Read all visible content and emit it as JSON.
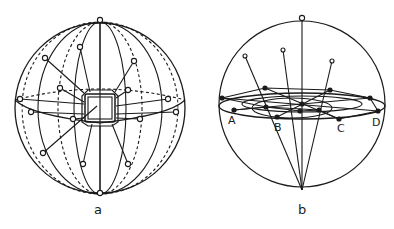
{
  "figure": {
    "panels": [
      {
        "id": "a",
        "label": "a",
        "center": [
          100,
          108
        ],
        "radius": 85
      },
      {
        "id": "b",
        "label": "b",
        "center": [
          302,
          105
        ],
        "radius": 83,
        "point_labels": [
          "A",
          "B",
          "C",
          "D"
        ]
      }
    ],
    "colors": {
      "ink": "#1a1a1a",
      "background": "#ffffff"
    }
  }
}
